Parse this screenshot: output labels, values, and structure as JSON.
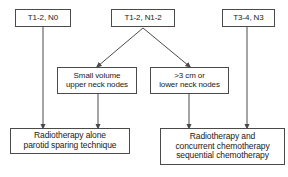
{
  "diagram": {
    "type": "flowchart",
    "canvas": {
      "width": 288,
      "height": 177
    },
    "style": {
      "box_border_color": "#4a4a4a",
      "box_fill_color": "#ffffff",
      "text_color": "#1a1a1a",
      "arrow_color": "#4a4a4a",
      "background": "#ffffff"
    },
    "nodes": [
      {
        "id": "stage-t12-n0",
        "role": "stage",
        "lines": [
          "T1-2, N0"
        ],
        "x": 15,
        "y": 9,
        "w": 56,
        "h": 18
      },
      {
        "id": "stage-t12-n12",
        "role": "stage",
        "lines": [
          "T1-2, N1-2"
        ],
        "x": 111,
        "y": 9,
        "w": 64,
        "h": 18
      },
      {
        "id": "stage-t34-n3",
        "role": "stage",
        "lines": [
          "T3-4, N3"
        ],
        "x": 222,
        "y": 9,
        "w": 53,
        "h": 18
      },
      {
        "id": "nodal-small-volume",
        "role": "criterion",
        "lines": [
          "Small volume",
          "upper neck nodes"
        ],
        "x": 57,
        "y": 67,
        "w": 80,
        "h": 27
      },
      {
        "id": "nodal-large-or-lower",
        "role": "criterion",
        "lines": [
          ">3 cm or",
          "lower neck nodes"
        ],
        "x": 150,
        "y": 67,
        "w": 79,
        "h": 27
      },
      {
        "id": "treatment-rt-alone",
        "role": "outcome",
        "lines": [
          "Radiotherapy alone",
          "parotid sparing technique"
        ],
        "x": 10,
        "y": 128,
        "w": 120,
        "h": 26
      },
      {
        "id": "treatment-rt-chemo",
        "role": "outcome",
        "lines": [
          "Radiotherapy and",
          "concurrent chemotherapy",
          "sequential chemotherapy"
        ],
        "x": 160,
        "y": 128,
        "w": 125,
        "h": 37
      }
    ],
    "edges": [
      {
        "id": "edge-t12n0-to-rt-alone",
        "from": "stage-t12-n0",
        "to": "treatment-rt-alone",
        "kind": "vertical",
        "x1": 43,
        "y1": 27,
        "x2": 43,
        "y2": 127
      },
      {
        "id": "edge-t12n12-to-small-volume",
        "from": "stage-t12-n12",
        "to": "nodal-small-volume",
        "kind": "diagonal",
        "x1": 143,
        "y1": 28,
        "x2": 98,
        "y2": 66
      },
      {
        "id": "edge-t12n12-to-large-lower",
        "from": "stage-t12-n12",
        "to": "nodal-large-or-lower",
        "kind": "diagonal",
        "x1": 143,
        "y1": 28,
        "x2": 189,
        "y2": 66
      },
      {
        "id": "edge-small-volume-to-rt-alone",
        "from": "nodal-small-volume",
        "to": "treatment-rt-alone",
        "kind": "vertical",
        "x1": 98,
        "y1": 94,
        "x2": 98,
        "y2": 127
      },
      {
        "id": "edge-large-lower-to-rt-chemo",
        "from": "nodal-large-or-lower",
        "to": "treatment-rt-chemo",
        "kind": "vertical",
        "x1": 189,
        "y1": 94,
        "x2": 189,
        "y2": 127
      },
      {
        "id": "edge-t34n3-to-rt-chemo",
        "from": "stage-t34-n3",
        "to": "treatment-rt-chemo",
        "kind": "vertical",
        "x1": 247,
        "y1": 27,
        "x2": 247,
        "y2": 127
      }
    ]
  }
}
